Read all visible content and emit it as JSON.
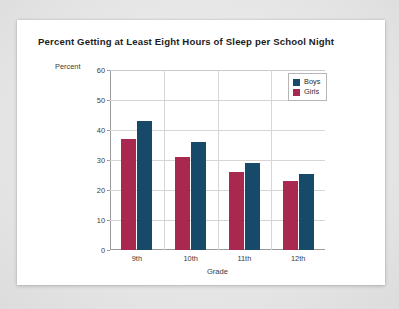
{
  "card": {
    "title": "Percent Getting at Least Eight Hours of Sleep per School Night",
    "percent_caption": "Percent"
  },
  "legend": {
    "entries": [
      {
        "label": "Boys",
        "color": "#174a68",
        "swatch_name": "legend-swatch-boys"
      },
      {
        "label": "Girls",
        "color": "#a8284f",
        "swatch_name": "legend-swatch-girls"
      }
    ]
  },
  "chart_data": {
    "type": "bar",
    "title": "Percent Getting at Least Eight Hours of Sleep per School Night",
    "xlabel": "Grade",
    "ylabel": "Percent",
    "categories": [
      "9th",
      "10th",
      "11th",
      "12th"
    ],
    "series": [
      {
        "name": "Girls",
        "color": "#a8284f",
        "values": [
          37,
          31,
          26,
          23
        ]
      },
      {
        "name": "Boys",
        "color": "#174a68",
        "values": [
          43,
          36,
          29,
          25.5
        ]
      }
    ],
    "series_draw_order": [
      "Girls",
      "Boys"
    ],
    "ylim": [
      0,
      60
    ],
    "yticks": [
      0,
      10,
      20,
      30,
      40,
      50,
      60
    ],
    "ytick_labels": [
      "0",
      "10",
      "20",
      "30",
      "40",
      "50",
      "60"
    ],
    "grid": {
      "horizontal": true,
      "vertical": true
    },
    "legend_position": "top-right"
  }
}
